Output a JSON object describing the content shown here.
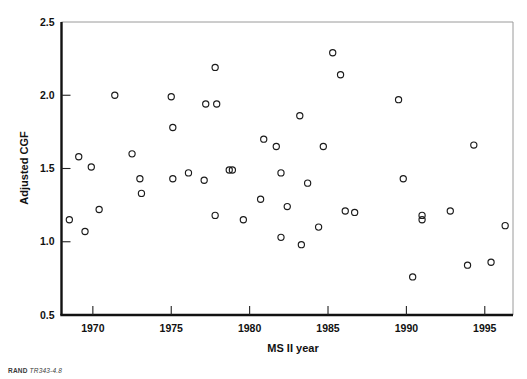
{
  "footer": {
    "brand": "RAND",
    "code": "TR343-4.8"
  },
  "chart_data": {
    "type": "scatter",
    "title": "",
    "xlabel": "MS II year",
    "ylabel": "Adjusted CGF",
    "xlim": [
      1968.0,
      1996.8
    ],
    "ylim": [
      0.5,
      2.5
    ],
    "xticks": [
      1970,
      1975,
      1980,
      1985,
      1990,
      1995
    ],
    "xticklabels": [
      "1970",
      "1975",
      "1980",
      "1985",
      "1990",
      "1995"
    ],
    "yticks": [
      0.5,
      1.0,
      1.5,
      2.0,
      2.5
    ],
    "yticklabels": [
      "0.5",
      "1.0",
      "1.5",
      "2.0",
      "2.5"
    ],
    "grid": false,
    "legend": "none",
    "marker": "open-circle",
    "marker_color": "#1b1b1b",
    "x": [
      1968.5,
      1969.1,
      1969.5,
      1969.9,
      1970.4,
      1971.4,
      1972.5,
      1973.0,
      1973.1,
      1975.0,
      1975.1,
      1975.1,
      1976.1,
      1977.1,
      1977.2,
      1977.8,
      1977.8,
      1977.9,
      1978.7,
      1978.9,
      1979.6,
      1980.7,
      1980.9,
      1981.7,
      1982.0,
      1982.0,
      1982.4,
      1983.2,
      1983.3,
      1983.7,
      1984.4,
      1984.7,
      1985.3,
      1985.8,
      1986.1,
      1986.7,
      1989.5,
      1989.8,
      1990.4,
      1991.0,
      1991.0,
      1992.8,
      1993.9,
      1994.3,
      1995.4,
      1996.3
    ],
    "y": [
      1.15,
      1.58,
      1.07,
      1.51,
      1.22,
      2.0,
      1.6,
      1.43,
      1.33,
      1.99,
      1.78,
      1.43,
      1.47,
      1.42,
      1.94,
      2.19,
      1.18,
      1.94,
      1.49,
      1.49,
      1.15,
      1.29,
      1.7,
      1.65,
      1.47,
      1.03,
      1.24,
      1.86,
      0.98,
      1.4,
      1.1,
      1.65,
      2.29,
      2.14,
      1.21,
      1.2,
      1.97,
      1.43,
      0.76,
      1.18,
      1.15,
      1.21,
      0.84,
      1.66,
      0.86,
      1.11
    ]
  }
}
